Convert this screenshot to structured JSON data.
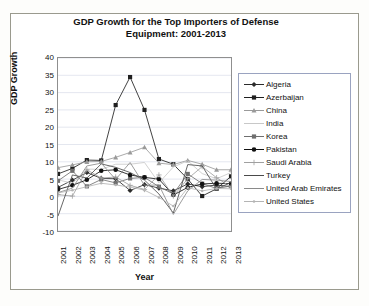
{
  "figure": {
    "title_line1": "GDP Growth for the Top Importers of Defense",
    "title_line2": "Equipment: 2001-2013",
    "xlabel": "Year",
    "ylabel": "GDP Growth"
  },
  "chart_data": {
    "type": "line",
    "title": "GDP Growth for the Top Importers of Defense Equipment: 2001-2013",
    "xlabel": "Year",
    "ylabel": "GDP Growth",
    "grid": "horizontal",
    "legend_position": "right",
    "categories": [
      "2001",
      "2002",
      "2003",
      "2004",
      "2005",
      "2006",
      "2007",
      "2008",
      "2009",
      "2010",
      "2011",
      "2012",
      "2013"
    ],
    "ylim": [
      -10,
      40
    ],
    "ytick_step": 5,
    "yticks": [
      "40",
      "35",
      "30",
      "25",
      "20",
      "15",
      "10",
      "5",
      "0",
      "-5",
      "-10"
    ],
    "series": [
      {
        "name": "Algeria",
        "marker": "diamond",
        "color": "#2b2b2b",
        "values": [
          2.6,
          4.7,
          6.9,
          5.2,
          5.1,
          1.7,
          3.4,
          2.4,
          1.6,
          3.6,
          2.8,
          3.3,
          2.8
        ]
      },
      {
        "name": "Azerbaijan",
        "marker": "square",
        "color": "#1f1f1f",
        "values": [
          6.5,
          8.1,
          10.5,
          10.4,
          26.4,
          34.5,
          25.0,
          10.8,
          9.3,
          5.0,
          0.1,
          2.2,
          5.8
        ]
      },
      {
        "name": "China",
        "marker": "triangle",
        "color": "#9a9a9a",
        "values": [
          8.3,
          9.1,
          10.0,
          10.1,
          11.3,
          12.7,
          14.2,
          9.6,
          9.2,
          10.4,
          9.3,
          7.7,
          7.7
        ]
      },
      {
        "name": "India",
        "marker": "none",
        "color": "#c8c8c8",
        "values": [
          4.8,
          3.8,
          7.9,
          7.8,
          9.3,
          9.3,
          9.8,
          3.9,
          8.5,
          10.3,
          6.6,
          5.1,
          6.9
        ]
      },
      {
        "name": "Korea",
        "marker": "square",
        "color": "#6f6f6f",
        "values": [
          4.5,
          7.4,
          2.9,
          4.9,
          3.9,
          5.2,
          5.5,
          2.8,
          0.7,
          6.5,
          3.7,
          2.3,
          3.0
        ]
      },
      {
        "name": "Pakistan",
        "marker": "circle",
        "color": "#111111",
        "values": [
          2.0,
          3.2,
          4.8,
          7.4,
          7.7,
          6.2,
          5.5,
          5.0,
          0.4,
          2.6,
          3.6,
          3.8,
          3.7
        ]
      },
      {
        "name": "Saudi Arabia",
        "marker": "plus",
        "color": "#a0a0a0",
        "values": [
          0.5,
          0.1,
          7.7,
          5.3,
          5.6,
          3.2,
          2.0,
          6.2,
          0.1,
          5.1,
          8.6,
          5.4,
          2.7
        ]
      },
      {
        "name": "Turkey",
        "marker": "none",
        "color": "#4a4a4a",
        "values": [
          -5.7,
          6.2,
          5.3,
          9.4,
          8.4,
          6.9,
          4.7,
          0.7,
          -4.8,
          9.2,
          8.8,
          2.1,
          4.1
        ]
      },
      {
        "name": "United Arab Emirates",
        "marker": "none",
        "color": "#8a8a8a",
        "values": [
          1.1,
          2.4,
          8.8,
          9.6,
          4.9,
          9.8,
          3.2,
          3.3,
          -5.2,
          1.6,
          4.9,
          4.7,
          4.3
        ]
      },
      {
        "name": "United States",
        "marker": "dot",
        "color": "#b4b4b4",
        "values": [
          1.0,
          1.8,
          2.8,
          3.8,
          3.3,
          2.7,
          1.8,
          -0.3,
          -2.8,
          2.5,
          1.6,
          2.3,
          2.2
        ]
      }
    ]
  },
  "legend": {
    "items": [
      {
        "label": "Algeria"
      },
      {
        "label": "Azerbaijan"
      },
      {
        "label": "China"
      },
      {
        "label": "India"
      },
      {
        "label": "Korea"
      },
      {
        "label": "Pakistan"
      },
      {
        "label": "Saudi Arabia"
      },
      {
        "label": "Turkey"
      },
      {
        "label": "United Arab Emirates"
      },
      {
        "label": "United States"
      }
    ]
  }
}
